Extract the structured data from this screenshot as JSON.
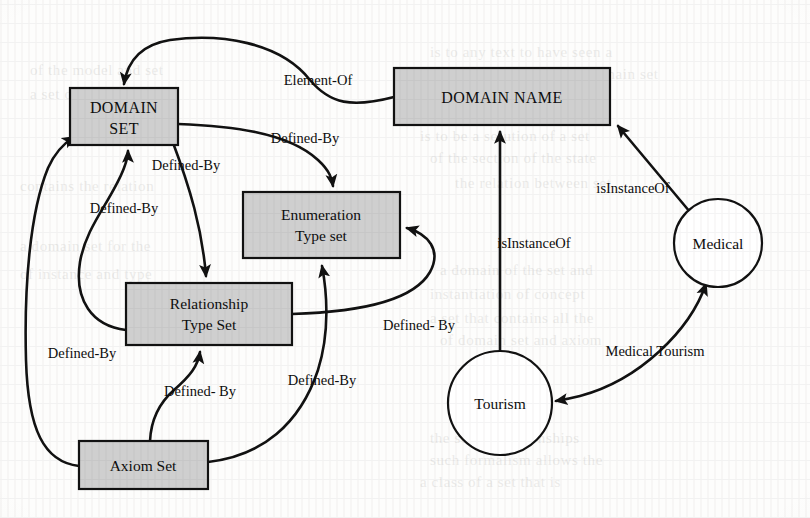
{
  "figure": {
    "kind": "ontology-graph",
    "background_color": "#fdfdfc",
    "node_fill_color": "#cfcfcf",
    "circle_fill_color": "#ffffff",
    "stroke_color": "#111111"
  },
  "nodes": [
    {
      "id": "domain_set",
      "label_line1": "DOMAIN",
      "label_line2": "SET",
      "shape": "rect",
      "x": 70,
      "y": 88,
      "w": 108,
      "h": 57
    },
    {
      "id": "domain_name",
      "label_line1": "DOMAIN NAME",
      "label_line2": "",
      "shape": "rect",
      "x": 394,
      "y": 68,
      "w": 216,
      "h": 57
    },
    {
      "id": "enumeration_type",
      "label_line1": "Enumeration",
      "label_line2": "Type set",
      "shape": "rect",
      "x": 243,
      "y": 192,
      "w": 157,
      "h": 66
    },
    {
      "id": "relationship_type",
      "label_line1": "Relationship",
      "label_line2": "Type Set",
      "shape": "rect",
      "x": 126,
      "y": 283,
      "w": 166,
      "h": 62
    },
    {
      "id": "axiom_set",
      "label_line1": "Axiom Set",
      "label_line2": "",
      "shape": "rect",
      "x": 79,
      "y": 441,
      "w": 129,
      "h": 48
    },
    {
      "id": "medical",
      "label_line1": "Medical",
      "label_line2": "",
      "shape": "circle",
      "cx": 718,
      "cy": 243,
      "r": 44
    },
    {
      "id": "tourism",
      "label_line1": "Tourism",
      "label_line2": "",
      "shape": "circle",
      "cx": 500,
      "cy": 403,
      "r": 52
    }
  ],
  "edges": [
    {
      "id": "e_element_of",
      "label": "Element-Of",
      "from": "domain_name",
      "to": "domain_set",
      "label_x": 318,
      "label_y": 85
    },
    {
      "id": "e_ds_enum",
      "label": "Defined-By",
      "from": "domain_set",
      "to": "enumeration_type",
      "label_x": 305,
      "label_y": 143
    },
    {
      "id": "e_ds_rel",
      "label": "Defined-By",
      "from": "domain_set",
      "to": "relationship_type",
      "label_x": 186,
      "label_y": 170
    },
    {
      "id": "e_rel_ds",
      "label": "Defined-By",
      "from": "relationship_type",
      "to": "domain_set",
      "label_x": 124,
      "label_y": 213
    },
    {
      "id": "e_axiom_ds",
      "label": "Defined-By",
      "from": "axiom_set",
      "to": "domain_set",
      "label_x": 82,
      "label_y": 358
    },
    {
      "id": "e_axiom_rel",
      "label": "Defined- By",
      "from": "axiom_set",
      "to": "relationship_type",
      "label_x": 200,
      "label_y": 396
    },
    {
      "id": "e_axiom_enum",
      "label": "Defined-By",
      "from": "axiom_set",
      "to": "enumeration_type",
      "label_x": 322,
      "label_y": 385
    },
    {
      "id": "e_rel_enum",
      "label": "Defined- By",
      "from": "relationship_type",
      "to": "enumeration_type",
      "label_x": 419,
      "label_y": 330
    },
    {
      "id": "e_tourism_instance",
      "label": "isInstanceOf",
      "from": "tourism",
      "to": "domain_name",
      "label_x": 534,
      "label_y": 248
    },
    {
      "id": "e_medical_instance",
      "label": "isInstanceOf",
      "from": "medical",
      "to": "domain_name",
      "label_x": 633,
      "label_y": 193
    },
    {
      "id": "e_medical_tourism",
      "label": "Medical Tourism",
      "from": "medical",
      "to": "tourism",
      "label_x": 655,
      "label_y": 356
    }
  ],
  "ghost_text": [
    {
      "text": "is to any text to have seen a",
      "x": 430,
      "y": 44
    },
    {
      "text": "on the relationship of a domain set",
      "x": 430,
      "y": 66
    },
    {
      "text": "a concept is a set of the",
      "x": 430,
      "y": 90
    },
    {
      "text": "is to be a solution of a set",
      "x": 420,
      "y": 128
    },
    {
      "text": "of the section of the state",
      "x": 430,
      "y": 150
    },
    {
      "text": "the relation between set",
      "x": 455,
      "y": 175
    },
    {
      "text": "a domain of the set and",
      "x": 440,
      "y": 262
    },
    {
      "text": "instantiation of concept",
      "x": 430,
      "y": 286
    },
    {
      "text": "a set that contains all the",
      "x": 430,
      "y": 310
    },
    {
      "text": "of domain set and axiom",
      "x": 440,
      "y": 332
    },
    {
      "text": "the set of relationships",
      "x": 430,
      "y": 430
    },
    {
      "text": "such formalism allows the",
      "x": 430,
      "y": 452
    },
    {
      "text": "a class of a set that is",
      "x": 420,
      "y": 474
    },
    {
      "text": "of the model and set",
      "x": 30,
      "y": 62
    },
    {
      "text": "a set of axioms that",
      "x": 30,
      "y": 86
    },
    {
      "text": "contains the relation",
      "x": 20,
      "y": 178
    },
    {
      "text": "a domain set for the",
      "x": 20,
      "y": 238
    },
    {
      "text": "of instance and type",
      "x": 20,
      "y": 266
    }
  ]
}
